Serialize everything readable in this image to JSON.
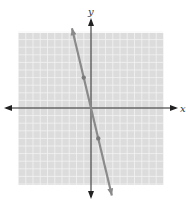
{
  "chart_data": {
    "type": "line",
    "title": "",
    "xlabel": "x",
    "ylabel": "y",
    "xlim": [
      -10,
      10
    ],
    "ylim": [
      -10,
      10
    ],
    "grid": true,
    "legend": null,
    "series": [
      {
        "name": "y = -4x",
        "equation": "y = -4x",
        "points": [
          [
            -1,
            4
          ],
          [
            0,
            0
          ],
          [
            1,
            -4
          ]
        ],
        "color": "#8a8a8a"
      }
    ],
    "tick_labels": []
  },
  "colors": {
    "grid_background": "#d9d9d9",
    "grid_lines": "#f2f2f2",
    "axis": "#222222",
    "line": "#8a8a8a"
  }
}
